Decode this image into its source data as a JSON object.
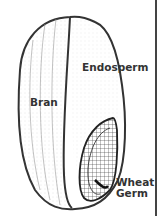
{
  "diagram": {
    "labels": {
      "bran": "Bran",
      "endosperm": "Endosperm",
      "germ_line1": "Wheat",
      "germ_line2": "Germ"
    },
    "colors": {
      "outline": "#333333",
      "background": "#ffffff",
      "stipple": "#777777"
    }
  }
}
